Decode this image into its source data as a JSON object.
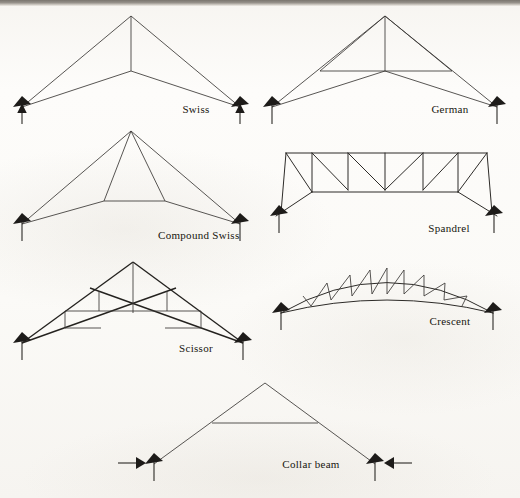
{
  "page": {
    "background_color": "#fbfaf8",
    "ink_color": "#2d2b28",
    "width": 520,
    "height": 498
  },
  "figures": [
    {
      "id": "swiss",
      "label": "Swiss",
      "label_x": 196,
      "label_y": 113,
      "support_left": {
        "x": 22,
        "y": 107,
        "type": "roller-up-arrow"
      },
      "support_right": {
        "x": 240,
        "y": 107,
        "type": "roller-up-arrow"
      },
      "description": "Simple king-post style truss: two top chords to apex, two lower chords to a central node, vertical king post.",
      "members": [
        {
          "name": "top-chord-left",
          "d": "M22,107 L131,16"
        },
        {
          "name": "top-chord-right",
          "d": "M131,16 L240,107"
        },
        {
          "name": "bottom-chord-left",
          "d": "M22,107 L131,71"
        },
        {
          "name": "bottom-chord-right",
          "d": "M131,71 L240,107"
        },
        {
          "name": "king-post",
          "d": "M131,16 L131,71"
        }
      ]
    },
    {
      "id": "german",
      "label": "German",
      "label_x": 450,
      "label_y": 113,
      "support_left": {
        "x": 272,
        "y": 107,
        "type": "roller-up-arrow"
      },
      "support_right": {
        "x": 497,
        "y": 107,
        "type": "roller-up-arrow"
      },
      "description": "Like the Swiss but with an added horizontal strut crossing the king post and diagonals to the chord mid-points.",
      "members": [
        {
          "name": "top-chord-left",
          "d": "M272,107 L385,16"
        },
        {
          "name": "top-chord-right",
          "d": "M385,16 L497,107"
        },
        {
          "name": "bottom-chord-left",
          "d": "M272,107 L385,71"
        },
        {
          "name": "bottom-chord-right",
          "d": "M385,71 L497,107"
        },
        {
          "name": "king-post",
          "d": "M385,16 L385,71"
        },
        {
          "name": "collar-strut",
          "d": "M320,71 L452,71"
        },
        {
          "name": "web-left",
          "d": "M320,71 L385,16"
        },
        {
          "name": "web-right",
          "d": "M452,71 L385,16"
        }
      ]
    },
    {
      "id": "compound-swiss",
      "label": "Compound Swiss",
      "label_x": 158,
      "label_y": 239,
      "support_left": {
        "x": 22,
        "y": 224,
        "type": "roller-up-arrow"
      },
      "support_right": {
        "x": 240,
        "y": 224,
        "type": "roller-up-arrow"
      },
      "description": "Swiss truss with an inner trapezoidal panel; two inclined struts drop from the apex to a raised straining beam.",
      "members": [
        {
          "name": "top-chord-left",
          "d": "M22,224 L131,131"
        },
        {
          "name": "top-chord-right",
          "d": "M131,131 L240,224"
        },
        {
          "name": "bottom-chord-left",
          "d": "M22,224 L104,201"
        },
        {
          "name": "bottom-chord-mid",
          "d": "M104,201 L165,201"
        },
        {
          "name": "bottom-chord-right",
          "d": "M165,201 L240,224"
        },
        {
          "name": "strut-left",
          "d": "M131,131 L104,201"
        },
        {
          "name": "strut-right",
          "d": "M131,131 L165,201"
        }
      ]
    },
    {
      "id": "spandrel",
      "label": "Spandrel",
      "label_x": 449,
      "label_y": 232,
      "support_left": {
        "x": 276,
        "y": 216,
        "type": "roller-up-arrow"
      },
      "support_right": {
        "x": 497,
        "y": 216,
        "type": "roller-up-arrow"
      },
      "description": "Flat-topped parallel-chord truss with verticals and diagonals; lower chord is stepped, rising from the supports to a flat centre panel.",
      "top_chord_y": 153,
      "mid_chord_y": 190,
      "verticals_x": [
        286,
        312,
        348,
        385,
        423,
        458,
        487
      ],
      "members": [
        {
          "name": "top-chord",
          "d": "M286,153 L487,153"
        },
        {
          "name": "bottom-chord-left-rise",
          "d": "M276,216 L312,192"
        },
        {
          "name": "bottom-chord-flat",
          "d": "M312,192 L458,192"
        },
        {
          "name": "bottom-chord-right-rise",
          "d": "M458,192 L497,216"
        },
        {
          "name": "vertical-1",
          "d": "M286,153 L281,213"
        },
        {
          "name": "vertical-2",
          "d": "M312,153 L312,192"
        },
        {
          "name": "vertical-3",
          "d": "M348,153 L348,190"
        },
        {
          "name": "vertical-4",
          "d": "M385,153 L385,190"
        },
        {
          "name": "vertical-5",
          "d": "M423,153 L423,190"
        },
        {
          "name": "vertical-6",
          "d": "M458,153 L458,192"
        },
        {
          "name": "vertical-7",
          "d": "M487,153 L492,213"
        },
        {
          "name": "diag-1",
          "d": "M286,153 L312,192"
        },
        {
          "name": "diag-2",
          "d": "M312,153 L348,190"
        },
        {
          "name": "diag-3",
          "d": "M348,153 L385,190"
        },
        {
          "name": "diag-4",
          "d": "M423,153 L385,190"
        },
        {
          "name": "diag-5",
          "d": "M458,153 L423,190"
        },
        {
          "name": "diag-6",
          "d": "M487,153 L458,192"
        }
      ]
    },
    {
      "id": "scissor",
      "label": "Scissor",
      "label_x": 196,
      "label_y": 352,
      "support_left": {
        "x": 22,
        "y": 343,
        "type": "roller-up-arrow"
      },
      "support_right": {
        "x": 243,
        "y": 343,
        "type": "roller-up-arrow"
      },
      "description": "Scissor truss: crossing inclined bottom chords run from each support up past the centre, with stepped verticals and horizontals forming the webs.",
      "members": [
        {
          "name": "top-chord-left",
          "d": "M22,343 L133,262"
        },
        {
          "name": "top-chord-right",
          "d": "M133,262 L243,343"
        },
        {
          "name": "scissor-chord-left",
          "d": "M22,343 L176,288"
        },
        {
          "name": "scissor-chord-right",
          "d": "M243,343 L90,288"
        },
        {
          "name": "king-post",
          "d": "M133,262 L133,313"
        },
        {
          "name": "step-vert-l1",
          "d": "M99,290 L99,311"
        },
        {
          "name": "step-horz-l1",
          "d": "M99,311 L133,311"
        },
        {
          "name": "step-vert-l2",
          "d": "M65,310 L65,327"
        },
        {
          "name": "step-horz-l2",
          "d": "M65,327 L99,327"
        },
        {
          "name": "step-vert-l3",
          "d": "M65,310 L99,310"
        },
        {
          "name": "step-vert-r1",
          "d": "M167,290 L167,311"
        },
        {
          "name": "step-horz-r1",
          "d": "M133,311 L167,311"
        },
        {
          "name": "step-vert-r2",
          "d": "M201,310 L201,327"
        },
        {
          "name": "step-horz-r2",
          "d": "M167,327 L201,327"
        },
        {
          "name": "step-horz-r3",
          "d": "M167,310 L201,310"
        }
      ]
    },
    {
      "id": "crescent",
      "label": "Crescent",
      "label_x": 450,
      "label_y": 325,
      "support_left": {
        "x": 281,
        "y": 313,
        "type": "roller-up-arrow"
      },
      "support_right": {
        "x": 493,
        "y": 313,
        "type": "roller-up-arrow"
      },
      "description": "Bowstring / crescent truss: both chords are curved arcs bulging upward, linked by alternating verticals and diagonals.",
      "top_arc": "M281,313 Q387,252 493,313",
      "bottom_arc": "M281,313 Q387,287 493,313",
      "members": [
        {
          "name": "web-1",
          "d": "M303,296 L311,306"
        },
        {
          "name": "web-2",
          "d": "M327,283 L311,306"
        },
        {
          "name": "web-3",
          "d": "M327,283 L331,300"
        },
        {
          "name": "web-4",
          "d": "M350,275 L331,300"
        },
        {
          "name": "web-5",
          "d": "M350,275 L352,296"
        },
        {
          "name": "web-6",
          "d": "M370,270 L352,296"
        },
        {
          "name": "web-7",
          "d": "M370,270 L372,294"
        },
        {
          "name": "web-8",
          "d": "M387,268 L372,294"
        },
        {
          "name": "web-9",
          "d": "M387,268 L387,294"
        },
        {
          "name": "web-10",
          "d": "M404,270 L387,294"
        },
        {
          "name": "web-11",
          "d": "M404,270 L404,294"
        },
        {
          "name": "web-12",
          "d": "M424,275 L404,294"
        },
        {
          "name": "web-13",
          "d": "M424,275 L424,296"
        },
        {
          "name": "web-14",
          "d": "M445,283 L424,296"
        },
        {
          "name": "web-15",
          "d": "M445,283 L444,300"
        },
        {
          "name": "web-16",
          "d": "M467,296 L444,300"
        },
        {
          "name": "web-17",
          "d": "M467,296 L462,306"
        }
      ]
    },
    {
      "id": "collar-beam",
      "label": "Collar beam",
      "label_x": 311,
      "label_y": 468,
      "support_left": {
        "x": 154,
        "y": 464,
        "type": "roller-up-arrow-with-thrust"
      },
      "support_right": {
        "x": 375,
        "y": 464,
        "type": "roller-up-arrow-with-thrust"
      },
      "thrust_arrow_left": {
        "from_x": 120,
        "to_x": 146,
        "y": 464,
        "direction": "right"
      },
      "thrust_arrow_right": {
        "from_x": 410,
        "to_x": 384,
        "y": 464,
        "direction": "left"
      },
      "description": "Couple roof with a collar beam: two rafters meeting at a ridge, tied by a single horizontal collar; horizontal thrust arrows act inward at the feet.",
      "members": [
        {
          "name": "rafter-left",
          "d": "M154,464 L265,383"
        },
        {
          "name": "rafter-right",
          "d": "M265,383 L375,464"
        },
        {
          "name": "collar-beam",
          "d": "M212,423 L318,423"
        }
      ]
    }
  ]
}
